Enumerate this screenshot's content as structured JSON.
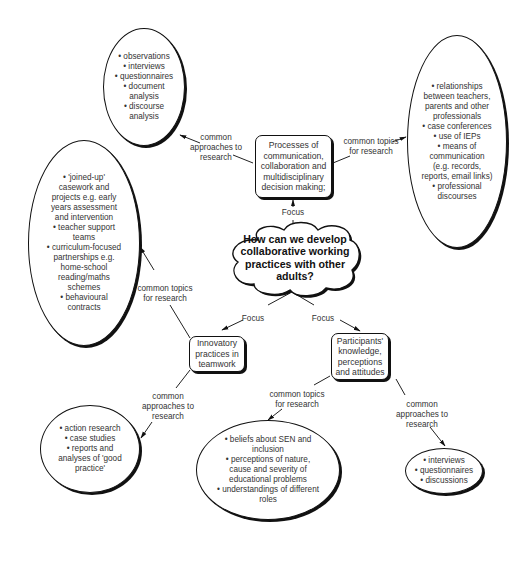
{
  "central": {
    "lines": [
      "How can we develop",
      "collaborative working",
      "practices with other",
      "adults?"
    ]
  },
  "focus_boxes": {
    "processes": {
      "lines": [
        "Processes of",
        "communication,",
        "collaboration and",
        "multidisciplinary",
        "decision making;"
      ]
    },
    "innovatory": {
      "lines": [
        "Innovatory",
        "practices in",
        "teamwork"
      ]
    },
    "participants": {
      "lines": [
        "Participants'",
        "knowledge,",
        "perceptions",
        "and attitudes"
      ]
    }
  },
  "connector_labels": {
    "focus": "Focus",
    "approaches": [
      "common",
      "approaches to",
      "research"
    ],
    "topics": [
      "common topics",
      "for research"
    ]
  },
  "ellipses": {
    "processes_approaches": {
      "lines": [
        "• observations",
        "• interviews",
        "• questionnaires",
        "• document",
        "analysis",
        "• discourse",
        "analysis"
      ]
    },
    "processes_topics": {
      "lines": [
        "• relationships",
        "between teachers,",
        "parents and other",
        "professionals",
        "• case conferences",
        "• use of IEPs",
        "• means of",
        "communication",
        "(e.g. records,",
        "reports, email links)",
        "• professional",
        "discourses"
      ]
    },
    "innovatory_topics": {
      "lines": [
        "• 'joined-up'",
        "casework and",
        "projects e.g. early",
        "years assessment",
        "and intervention",
        "• teacher support",
        "teams",
        "• curriculum-focused",
        "partnerships e.g.",
        "home-school",
        "reading/maths",
        "schemes",
        "• behavioural",
        "contracts"
      ]
    },
    "innovatory_approaches": {
      "lines": [
        "• action research",
        "• case studies",
        "• reports and",
        "analyses of 'good",
        "practice'"
      ]
    },
    "participants_topics": {
      "lines": [
        "• beliefs about  SEN and",
        "inclusion",
        "• perceptions of nature,",
        "cause and severity of",
        "educational problems",
        "• understandings of different",
        "roles"
      ]
    },
    "participants_approaches": {
      "lines": [
        "• interviews",
        "• questionnaires",
        "• discussions"
      ]
    }
  }
}
